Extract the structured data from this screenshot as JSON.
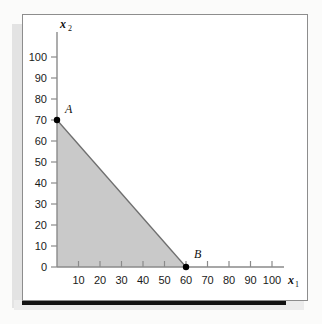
{
  "figure": {
    "background_color": "#fbfbfa",
    "frame_border_color": "#8d8d8d",
    "shadow_color": "#131313"
  },
  "chart_data": {
    "type": "area",
    "title": "",
    "subtitle": "",
    "xlabel": "x1",
    "ylabel": "x2",
    "xlabel_base": "x",
    "xlabel_sub": "1",
    "ylabel_base": "x",
    "ylabel_sub": "2",
    "xlim": [
      0,
      108
    ],
    "ylim": [
      0,
      108
    ],
    "xticks": [
      10,
      20,
      30,
      40,
      50,
      60,
      70,
      80,
      90,
      100
    ],
    "yticks": [
      0,
      10,
      20,
      30,
      40,
      50,
      60,
      70,
      80,
      90,
      100
    ],
    "xtick_labels": [
      "10",
      "20",
      "30",
      "40",
      "50",
      "60",
      "70",
      "80",
      "90",
      "100"
    ],
    "ytick_labels": [
      "0",
      "10",
      "20",
      "30",
      "40",
      "50",
      "60",
      "70",
      "80",
      "90",
      "100"
    ],
    "grid": false,
    "legend": false,
    "legend_position": "none",
    "shaded_region": {
      "name": "feasible-region",
      "fill_color": "#c9c9c9",
      "edge_color": "#6f6f6f",
      "vertices": [
        {
          "x": 0,
          "y": 0
        },
        {
          "x": 0,
          "y": 70
        },
        {
          "x": 60,
          "y": 0
        }
      ]
    },
    "constraint_line": {
      "name": "binding-constraint",
      "from": {
        "x": 0,
        "y": 70
      },
      "to": {
        "x": 60,
        "y": 0
      },
      "color": "#6f6f6f"
    },
    "annotations": [
      {
        "label": "A",
        "x": 0,
        "y": 70,
        "marker": "filled-circle",
        "marker_color": "#000000",
        "label_dx": 8,
        "label_dy": -7
      },
      {
        "label": "B",
        "x": 60,
        "y": 0,
        "marker": "filled-circle",
        "marker_color": "#000000",
        "label_dx": 8,
        "label_dy": -9
      }
    ],
    "axis_color": "#8a8a8a"
  }
}
